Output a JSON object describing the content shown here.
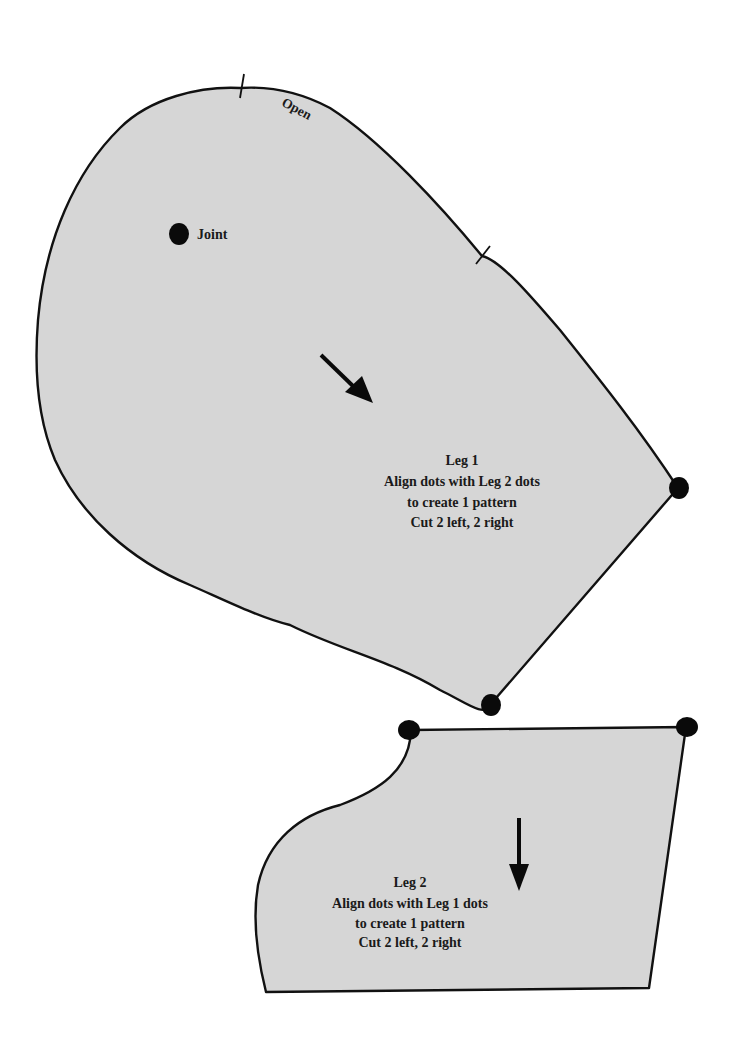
{
  "pieces": [
    {
      "name": "Leg 1",
      "fill": "#d6d6d6",
      "labels": {
        "title": "Leg 1",
        "line2": "Align dots with Leg 2 dots",
        "line3": "to create 1 pattern",
        "line4": "Cut 2 left, 2 right"
      },
      "annotations": {
        "open": "Open",
        "joint": "Joint"
      },
      "grain_arrow": "diagonal-down-right",
      "notches": 2,
      "alignment_dots": 2
    },
    {
      "name": "Leg 2",
      "fill": "#d6d6d6",
      "labels": {
        "title": "Leg 2",
        "line2": "Align dots with Leg 1 dots",
        "line3": "to create 1 pattern",
        "line4": "Cut 2 left, 2 right"
      },
      "grain_arrow": "down",
      "alignment_dots": 2
    }
  ]
}
